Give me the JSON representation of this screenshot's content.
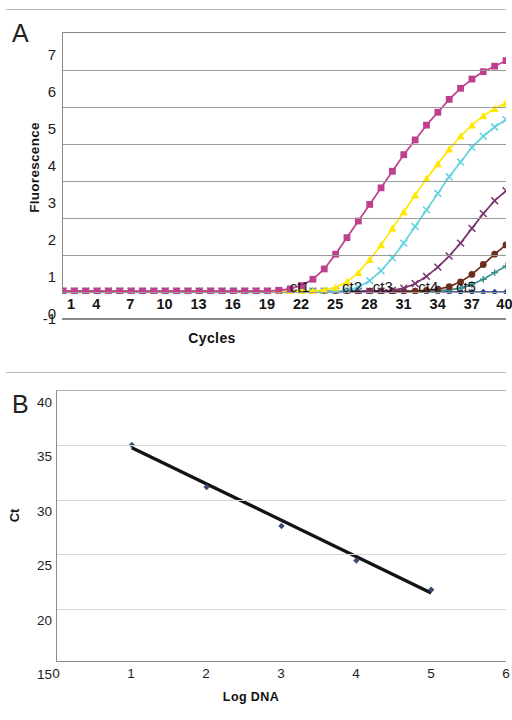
{
  "figure": {
    "panel_a_letter": "A",
    "panel_b_letter": "B"
  },
  "chart_data": [
    {
      "id": "panel-a",
      "type": "line",
      "title": "",
      "xlabel": "Cycles",
      "ylabel": "Fluorescence",
      "xlim": [
        1,
        40
      ],
      "ylim": [
        -1,
        7
      ],
      "xticks": [
        "1",
        "4",
        "7",
        "10",
        "13",
        "16",
        "19",
        "22",
        "25",
        "28",
        "31",
        "34",
        "37",
        "40"
      ],
      "yticks": [
        "7",
        "6",
        "5",
        "4",
        "3",
        "2",
        "1",
        "0",
        "-1"
      ],
      "grid": true,
      "legend": "none",
      "annotations": [
        {
          "text": "ct1",
          "x": 21.0,
          "y": 0.62
        },
        {
          "text": "ct2",
          "x": 25.6,
          "y": 0.62
        },
        {
          "text": "ct3",
          "x": 28.3,
          "y": 0.62
        },
        {
          "text": "ct4",
          "x": 32.3,
          "y": 0.62
        },
        {
          "text": "ct5",
          "x": 35.6,
          "y": 0.62
        }
      ],
      "series": [
        {
          "name": "dilution-1",
          "color": "#bf3f8f",
          "marker": "square",
          "x": [
            1,
            2,
            3,
            4,
            5,
            6,
            7,
            8,
            9,
            10,
            11,
            12,
            13,
            14,
            15,
            16,
            17,
            18,
            19,
            20,
            21,
            22,
            23,
            24,
            25,
            26,
            27,
            28,
            29,
            30,
            31,
            32,
            33,
            34,
            35,
            36,
            37,
            38,
            39,
            40
          ],
          "values": [
            0,
            0,
            0,
            0,
            0,
            0,
            0,
            0,
            0,
            0,
            0,
            0,
            0,
            0,
            0,
            0,
            0,
            0,
            0,
            0.02,
            0.06,
            0.15,
            0.32,
            0.6,
            1.0,
            1.45,
            1.9,
            2.35,
            2.8,
            3.25,
            3.7,
            4.1,
            4.5,
            4.85,
            5.2,
            5.5,
            5.75,
            5.95,
            6.1,
            6.25
          ]
        },
        {
          "name": "dilution-2",
          "color": "#ffe800",
          "marker": "triangle",
          "x": [
            1,
            2,
            3,
            4,
            5,
            6,
            7,
            8,
            9,
            10,
            11,
            12,
            13,
            14,
            15,
            16,
            17,
            18,
            19,
            20,
            21,
            22,
            23,
            24,
            25,
            26,
            27,
            28,
            29,
            30,
            31,
            32,
            33,
            34,
            35,
            36,
            37,
            38,
            39,
            40
          ],
          "values": [
            0,
            0,
            0,
            0,
            0,
            0,
            0,
            0,
            0,
            0,
            0,
            0,
            0,
            0,
            0,
            0,
            0,
            0,
            0,
            0,
            0,
            0,
            0,
            0.03,
            0.1,
            0.25,
            0.5,
            0.85,
            1.25,
            1.7,
            2.15,
            2.6,
            3.05,
            3.45,
            3.85,
            4.2,
            4.5,
            4.75,
            4.95,
            5.1
          ]
        },
        {
          "name": "dilution-3",
          "color": "#5fd2e0",
          "marker": "x",
          "x": [
            1,
            2,
            3,
            4,
            5,
            6,
            7,
            8,
            9,
            10,
            11,
            12,
            13,
            14,
            15,
            16,
            17,
            18,
            19,
            20,
            21,
            22,
            23,
            24,
            25,
            26,
            27,
            28,
            29,
            30,
            31,
            32,
            33,
            34,
            35,
            36,
            37,
            38,
            39,
            40
          ],
          "values": [
            0,
            0,
            0,
            0,
            0,
            0,
            0,
            0,
            0,
            0,
            0,
            0,
            0,
            0,
            0,
            0,
            0,
            0,
            0,
            0,
            0,
            0,
            0,
            0,
            0,
            0.02,
            0.1,
            0.28,
            0.55,
            0.9,
            1.3,
            1.75,
            2.2,
            2.65,
            3.1,
            3.5,
            3.9,
            4.2,
            4.45,
            4.65
          ]
        },
        {
          "name": "dilution-4",
          "color": "#7b3470",
          "marker": "x",
          "x": [
            1,
            2,
            3,
            4,
            5,
            6,
            7,
            8,
            9,
            10,
            11,
            12,
            13,
            14,
            15,
            16,
            17,
            18,
            19,
            20,
            21,
            22,
            23,
            24,
            25,
            26,
            27,
            28,
            29,
            30,
            31,
            32,
            33,
            34,
            35,
            36,
            37,
            38,
            39,
            40
          ],
          "values": [
            0,
            0,
            0,
            0,
            0,
            0,
            0,
            0,
            0,
            0,
            0,
            0,
            0,
            0,
            0,
            0,
            0,
            0,
            0,
            0,
            0,
            0,
            0,
            0,
            0,
            0,
            0,
            0,
            0,
            0.02,
            0.08,
            0.2,
            0.4,
            0.65,
            0.95,
            1.3,
            1.7,
            2.1,
            2.45,
            2.72
          ]
        },
        {
          "name": "dilution-5",
          "color": "#6b2d1e",
          "marker": "circle",
          "x": [
            1,
            2,
            3,
            4,
            5,
            6,
            7,
            8,
            9,
            10,
            11,
            12,
            13,
            14,
            15,
            16,
            17,
            18,
            19,
            20,
            21,
            22,
            23,
            24,
            25,
            26,
            27,
            28,
            29,
            30,
            31,
            32,
            33,
            34,
            35,
            36,
            37,
            38,
            39,
            40
          ],
          "values": [
            0,
            0,
            0,
            0,
            0,
            0,
            0,
            0,
            0,
            0,
            0,
            0,
            0,
            0,
            0,
            0,
            0,
            0,
            0,
            0,
            0,
            0,
            0,
            0,
            0,
            0,
            0,
            0,
            0,
            0,
            0,
            0,
            0.02,
            0.05,
            0.12,
            0.25,
            0.45,
            0.72,
            1.0,
            1.25
          ]
        },
        {
          "name": "dilution-6",
          "color": "#3a8f8f",
          "marker": "plus",
          "x": [
            1,
            2,
            3,
            4,
            5,
            6,
            7,
            8,
            9,
            10,
            11,
            12,
            13,
            14,
            15,
            16,
            17,
            18,
            19,
            20,
            21,
            22,
            23,
            24,
            25,
            26,
            27,
            28,
            29,
            30,
            31,
            32,
            33,
            34,
            35,
            36,
            37,
            38,
            39,
            40
          ],
          "values": [
            0,
            0,
            0,
            0,
            0,
            0,
            0,
            0,
            0,
            0,
            0,
            0,
            0,
            0,
            0,
            0,
            0,
            0,
            0,
            0,
            0,
            0,
            0,
            0,
            0,
            0,
            0,
            0,
            0,
            0,
            0,
            0,
            0,
            0.01,
            0.03,
            0.08,
            0.18,
            0.32,
            0.5,
            0.68
          ]
        },
        {
          "name": "no-template-control",
          "color": "#24408e",
          "marker": "diamond",
          "x": [
            1,
            2,
            3,
            4,
            5,
            6,
            7,
            8,
            9,
            10,
            11,
            12,
            13,
            14,
            15,
            16,
            17,
            18,
            19,
            20,
            21,
            22,
            23,
            24,
            25,
            26,
            27,
            28,
            29,
            30,
            31,
            32,
            33,
            34,
            35,
            36,
            37,
            38,
            39,
            40
          ],
          "values": [
            -0.03,
            -0.03,
            -0.03,
            -0.03,
            -0.03,
            -0.03,
            -0.03,
            -0.03,
            -0.03,
            -0.03,
            -0.03,
            -0.03,
            -0.03,
            -0.03,
            -0.03,
            -0.03,
            -0.03,
            -0.03,
            -0.03,
            -0.03,
            -0.03,
            -0.03,
            -0.03,
            -0.03,
            -0.03,
            -0.03,
            -0.03,
            -0.03,
            -0.03,
            -0.03,
            -0.03,
            -0.03,
            -0.03,
            -0.03,
            -0.03,
            -0.03,
            -0.03,
            -0.03,
            -0.03,
            -0.03
          ]
        }
      ]
    },
    {
      "id": "panel-b",
      "type": "scatter",
      "title": "",
      "xlabel": "Log DNA",
      "ylabel": "Ct",
      "xlim": [
        0,
        6
      ],
      "ylim": [
        15,
        40
      ],
      "xticks": [
        "0",
        "1",
        "2",
        "3",
        "4",
        "5",
        "6"
      ],
      "yticks": [
        "40",
        "35",
        "30",
        "25",
        "20",
        "15"
      ],
      "grid": true,
      "legend": "none",
      "point_color": "#3b4a74",
      "fitline_color": "#141414",
      "x": [
        1,
        2,
        3,
        4,
        5
      ],
      "values": [
        35.0,
        31.1,
        27.5,
        24.3,
        21.6
      ],
      "fit_line": {
        "x": [
          1,
          5
        ],
        "y": [
          34.75,
          21.3
        ]
      }
    }
  ]
}
